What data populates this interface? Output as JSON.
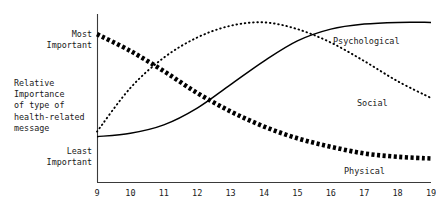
{
  "chart_data": {
    "type": "line",
    "title": "",
    "subtitle": "",
    "xlabel": "",
    "ylabel": "Relative Importance of type of health-related message",
    "xlim": [
      9,
      19
    ],
    "ylim": [
      0,
      1
    ],
    "grid": false,
    "legend_position": "inline-right-of-curves",
    "xticks": [
      "9",
      "10",
      "11",
      "12",
      "13",
      "14",
      "15",
      "16",
      "17",
      "18",
      "19"
    ],
    "ytick_labels": [
      "Most\nImportant",
      "Least\nImportant"
    ],
    "y_axis_note": "qualitative scale, no numeric ticks",
    "x": [
      9,
      10,
      11,
      12,
      13,
      14,
      15,
      16,
      17,
      18,
      19
    ],
    "series": [
      {
        "name": "Physical",
        "style": "thick-dotted-star-markers",
        "color": "#000000",
        "values": [
          0.88,
          0.78,
          0.66,
          0.53,
          0.42,
          0.33,
          0.26,
          0.21,
          0.17,
          0.15,
          0.14
        ]
      },
      {
        "name": "Social",
        "style": "fine-dotted",
        "color": "#000000",
        "values": [
          0.3,
          0.56,
          0.74,
          0.86,
          0.93,
          0.95,
          0.91,
          0.83,
          0.72,
          0.6,
          0.5
        ]
      },
      {
        "name": "Psychological",
        "style": "solid",
        "color": "#000000",
        "values": [
          0.27,
          0.29,
          0.34,
          0.44,
          0.58,
          0.72,
          0.84,
          0.91,
          0.94,
          0.95,
          0.95
        ]
      }
    ]
  },
  "axis": {
    "most_important_line1": "Most",
    "most_important_line2": "Important",
    "least_important_line1": "Least",
    "least_important_line2": "Important",
    "caption_line1": "Relative",
    "caption_line2": "Importance",
    "caption_line3": "of type of",
    "caption_line4": "health-related",
    "caption_line5": "message"
  },
  "xticks": {
    "t0": "9",
    "t1": "10",
    "t2": "11",
    "t3": "12",
    "t4": "13",
    "t5": "14",
    "t6": "15",
    "t7": "16",
    "t8": "17",
    "t9": "18",
    "t10": "19"
  },
  "series_labels": {
    "psychological": "Psychological",
    "social": "Social",
    "physical": "Physical"
  }
}
